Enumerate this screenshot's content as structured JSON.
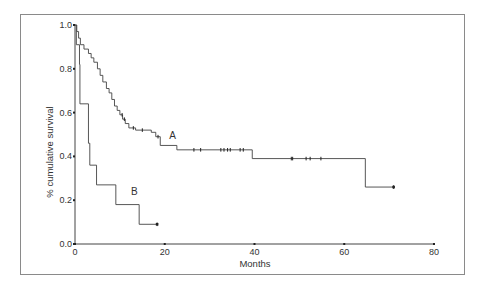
{
  "chart_data": {
    "type": "line",
    "subtype": "kaplan-meier step",
    "title": "",
    "xlabel": "Months",
    "ylabel": "% cumulative survival",
    "xlim": [
      0,
      80
    ],
    "ylim": [
      0,
      1.0
    ],
    "x_ticks": [
      "0",
      "20",
      "40",
      "60",
      "80"
    ],
    "y_ticks": [
      "0.0",
      "0.2",
      "0.4",
      "0.6",
      "0.8",
      "1.0"
    ],
    "grid": false,
    "legend": "none (curves labeled inline)",
    "series": [
      {
        "name": "A",
        "steps": [
          [
            0,
            1.0
          ],
          [
            0.4,
            0.97
          ],
          [
            0.8,
            0.94
          ],
          [
            1.2,
            0.91
          ],
          [
            2,
            0.89
          ],
          [
            3,
            0.87
          ],
          [
            3.6,
            0.85
          ],
          [
            4.2,
            0.83
          ],
          [
            5,
            0.8
          ],
          [
            5.6,
            0.77
          ],
          [
            6.2,
            0.74
          ],
          [
            7,
            0.71
          ],
          [
            7.6,
            0.69
          ],
          [
            8.2,
            0.66
          ],
          [
            8.8,
            0.63
          ],
          [
            9.4,
            0.61
          ],
          [
            10,
            0.59
          ],
          [
            10.6,
            0.57
          ],
          [
            11.2,
            0.55
          ],
          [
            12,
            0.53
          ],
          [
            13.5,
            0.52
          ],
          [
            17,
            0.51
          ],
          [
            18,
            0.49
          ],
          [
            19,
            0.45
          ],
          [
            22.7,
            0.43
          ],
          [
            39.5,
            0.39
          ],
          [
            64.7,
            0.26
          ]
        ],
        "end_month": 71,
        "censored_months": [
          10.5,
          11,
          13,
          15,
          18.5,
          26.5,
          28,
          32.5,
          33.2,
          34,
          34.6,
          36.8,
          37.5,
          48.2,
          48.5,
          51.5,
          52.4,
          54.8,
          71
        ]
      },
      {
        "name": "B",
        "steps": [
          [
            0,
            1.0
          ],
          [
            0.3,
            0.91
          ],
          [
            1,
            0.82
          ],
          [
            1.1,
            0.64
          ],
          [
            3,
            0.46
          ],
          [
            3.3,
            0.36
          ],
          [
            4.8,
            0.27
          ],
          [
            9.1,
            0.18
          ],
          [
            14.3,
            0.09
          ]
        ],
        "end_month": 18.3,
        "censored_months": [
          18.3
        ]
      }
    ],
    "annotations": [
      {
        "text": "A",
        "month": 21,
        "survival": 0.5
      },
      {
        "text": "B",
        "month": 12.5,
        "survival": 0.24
      }
    ]
  },
  "labels": {
    "xlabel": "Months",
    "ylabel": "% cumulative survival",
    "curve_a": "A",
    "curve_b": "B"
  }
}
